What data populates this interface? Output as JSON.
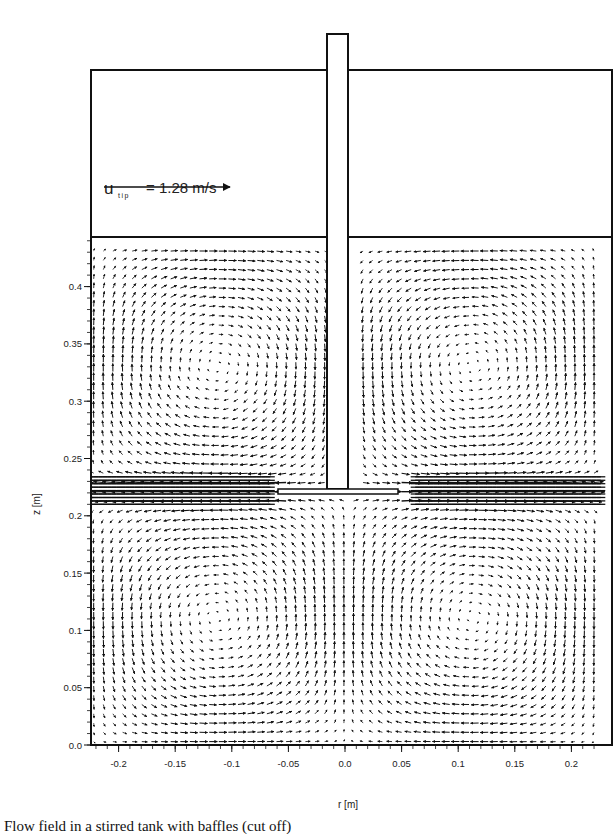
{
  "chart_data": {
    "type": "vector_field",
    "title": "",
    "xlabel": "r [m]",
    "ylabel": "z [m]",
    "xlim": [
      -0.225,
      0.225
    ],
    "ylim": [
      0.0,
      0.44
    ],
    "x_ticks": [
      "-0.2",
      "-0.15",
      "-0.1",
      "-0.05",
      "0.0",
      "0.05",
      "0.1",
      "0.15",
      "0.2"
    ],
    "x_tick_values": [
      -0.2,
      -0.15,
      -0.1,
      -0.05,
      0.0,
      0.05,
      0.1,
      0.15,
      0.2
    ],
    "y_ticks": [
      "0.0",
      "0.05",
      "0.1",
      "0.15",
      "0.2",
      "0.25",
      "0.3",
      "0.35",
      "0.4"
    ],
    "y_tick_values": [
      0.0,
      0.05,
      0.1,
      0.15,
      0.2,
      0.25,
      0.3,
      0.35,
      0.4
    ],
    "grid": false,
    "legend": {
      "label": "u",
      "subscript": "tip",
      "value_text": "= 1.28 m/s",
      "value": 1.28,
      "unit": "m/s",
      "arrow_direction": "right"
    },
    "features": {
      "impeller_disc": {
        "r_min": -0.058,
        "r_max": 0.058,
        "z": 0.222
      },
      "shaft": {
        "r_half_width": 0.01,
        "z_bottom": 0.225
      },
      "liquid_surface_z": 0.44,
      "circulation_loops": [
        {
          "center_r": -0.165,
          "center_z": 0.31,
          "rotation": "ccw"
        },
        {
          "center_r": 0.165,
          "center_z": 0.31,
          "rotation": "cw"
        },
        {
          "center_r": -0.165,
          "center_z": 0.14,
          "rotation": "cw"
        },
        {
          "center_r": 0.165,
          "center_z": 0.14,
          "rotation": "ccw"
        }
      ],
      "jet": "radial discharge stream at impeller plane z≈0.22 toward both walls"
    }
  },
  "caption": {
    "text": "Flow field in a stirred tank with baffles (cut off)"
  }
}
